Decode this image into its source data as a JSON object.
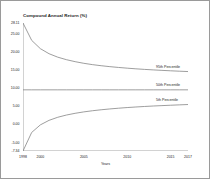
{
  "figure": {
    "title": "Compound Annual Return (%)",
    "border_color": "#9a9a9a",
    "axis_color": "#808080",
    "line_color": "#7d7d7d"
  },
  "chart_data": {
    "type": "line",
    "title": "Compound Annual Return (%)",
    "xlabel": "Years",
    "ylabel": "",
    "xlim": [
      1998,
      2017
    ],
    "ylim": [
      -7.34,
      28.11
    ],
    "grid": false,
    "legend_position": "right-inline",
    "xticks": [
      1998,
      2000,
      2005,
      2010,
      2015,
      2017
    ],
    "xtick_labels": [
      "1998",
      "2000",
      "2005",
      "2010",
      "2015",
      "2017"
    ],
    "yticks": [
      28.11,
      25.0,
      20.0,
      15.0,
      10.0,
      5.0,
      0.0,
      -5.0,
      -7.34
    ],
    "ytick_labels": [
      "28.11",
      "25.00",
      "20.00",
      "15.00",
      "10.00",
      "5.00",
      "0.00",
      "-5.00",
      "-7.34"
    ],
    "x": [
      1998,
      1999,
      2000,
      2001,
      2002,
      2003,
      2004,
      2005,
      2006,
      2007,
      2008,
      2009,
      2010,
      2011,
      2012,
      2013,
      2014,
      2015,
      2016,
      2017
    ],
    "series": [
      {
        "name": "95th Percentile",
        "label": "95th Percentile",
        "values": [
          28.11,
          23.3,
          21.0,
          19.6,
          18.65,
          17.95,
          17.4,
          16.95,
          16.58,
          16.28,
          16.02,
          15.8,
          15.6,
          15.42,
          15.26,
          15.12,
          14.99,
          14.87,
          14.76,
          14.66
        ]
      },
      {
        "name": "50th Percentile",
        "label": "50th Percentile",
        "values": [
          9.6,
          9.6,
          9.6,
          9.6,
          9.6,
          9.6,
          9.6,
          9.6,
          9.6,
          9.6,
          9.6,
          9.6,
          9.6,
          9.6,
          9.6,
          9.6,
          9.6,
          9.6,
          9.6,
          9.6
        ]
      },
      {
        "name": "5th Percentile",
        "label": "5th Percentile",
        "values": [
          -7.34,
          -2.2,
          -0.1,
          1.15,
          2.0,
          2.62,
          3.1,
          3.49,
          3.81,
          4.08,
          4.31,
          4.51,
          4.69,
          4.85,
          4.99,
          5.12,
          5.23,
          5.34,
          5.44,
          5.53
        ]
      }
    ]
  }
}
